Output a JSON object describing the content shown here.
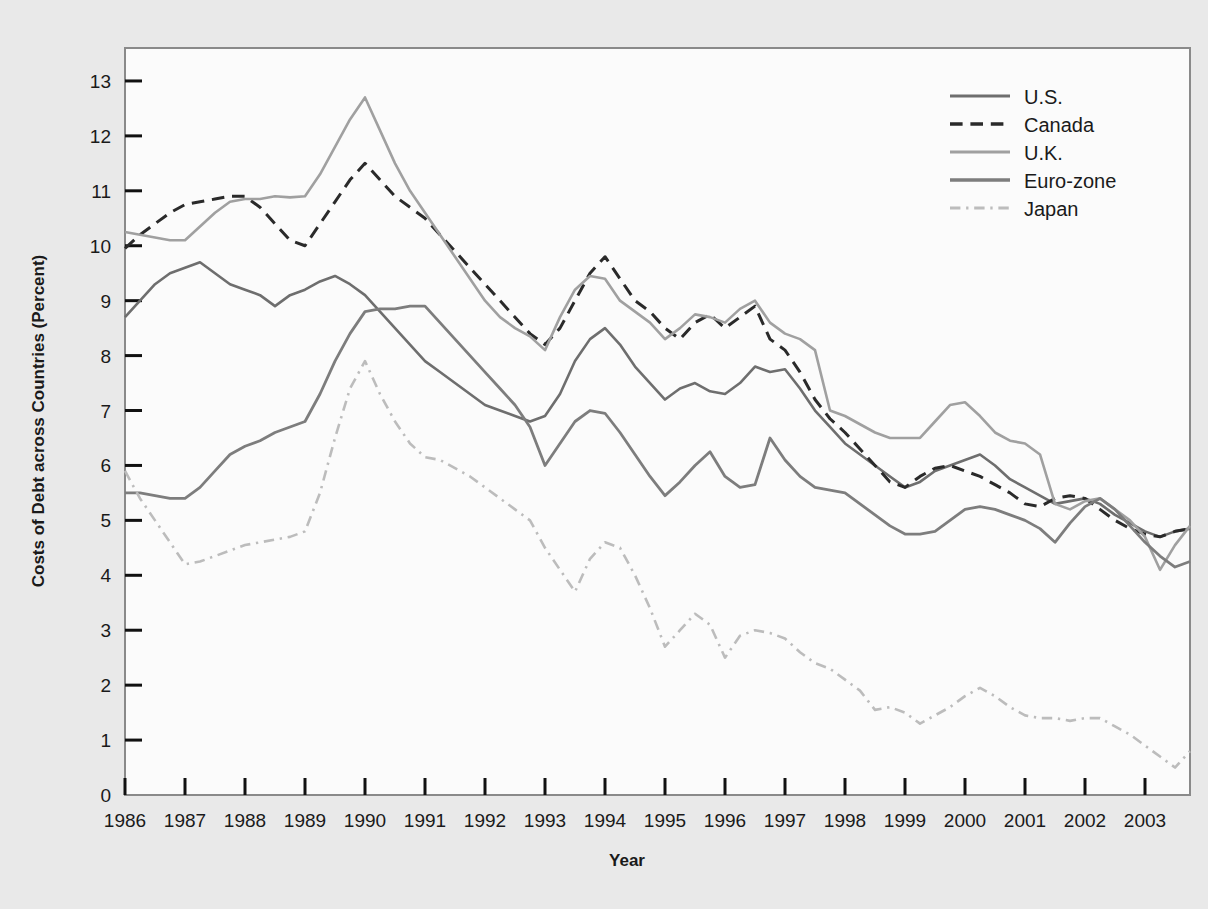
{
  "chart_data": {
    "type": "line",
    "title": "",
    "xlabel": "Year",
    "ylabel": "Costs of Debt across Countries (Percent)",
    "xlim": [
      1986,
      2003.75
    ],
    "ylim": [
      0,
      13.6
    ],
    "yticks": [
      0,
      1,
      2,
      3,
      4,
      5,
      6,
      7,
      8,
      9,
      10,
      11,
      12,
      13
    ],
    "xticks": [
      1986,
      1987,
      1988,
      1989,
      1990,
      1991,
      1992,
      1993,
      1994,
      1995,
      1996,
      1997,
      1998,
      1999,
      2000,
      2001,
      2002,
      2003
    ],
    "grid": false,
    "legend_position": "top-right",
    "frequency": "quarterly",
    "x": [
      1986,
      1986.25,
      1986.5,
      1986.75,
      1987,
      1987.25,
      1987.5,
      1987.75,
      1988,
      1988.25,
      1988.5,
      1988.75,
      1989,
      1989.25,
      1989.5,
      1989.75,
      1990,
      1990.25,
      1990.5,
      1990.75,
      1991,
      1991.25,
      1991.5,
      1991.75,
      1992,
      1992.25,
      1992.5,
      1992.75,
      1993,
      1993.25,
      1993.5,
      1993.75,
      1994,
      1994.25,
      1994.5,
      1994.75,
      1995,
      1995.25,
      1995.5,
      1995.75,
      1996,
      1996.25,
      1996.5,
      1996.75,
      1997,
      1997.25,
      1997.5,
      1997.75,
      1998,
      1998.25,
      1998.5,
      1998.75,
      1999,
      1999.25,
      1999.5,
      1999.75,
      2000,
      2000.25,
      2000.5,
      2000.75,
      2001,
      2001.25,
      2001.5,
      2001.75,
      2002,
      2002.25,
      2002.5,
      2002.75,
      2003,
      2003.25,
      2003.5,
      2003.75
    ],
    "series": [
      {
        "name": "U.S.",
        "color": "#6e6e6e",
        "style": "solid",
        "width": 2.6,
        "values": [
          8.7,
          9.0,
          9.3,
          9.5,
          9.6,
          9.7,
          9.5,
          9.3,
          9.2,
          9.1,
          8.9,
          9.1,
          9.2,
          9.35,
          9.45,
          9.3,
          9.1,
          8.8,
          8.5,
          8.2,
          7.9,
          7.7,
          7.5,
          7.3,
          7.1,
          7.0,
          6.9,
          6.8,
          6.9,
          7.3,
          7.9,
          8.3,
          8.5,
          8.2,
          7.8,
          7.5,
          7.2,
          7.4,
          7.5,
          7.35,
          7.3,
          7.5,
          7.8,
          7.7,
          7.75,
          7.4,
          7.0,
          6.7,
          6.4,
          6.2,
          6.0,
          5.8,
          5.6,
          5.7,
          5.9,
          6.0,
          6.1,
          6.2,
          6.0,
          5.75,
          5.6,
          5.45,
          5.3,
          5.35,
          5.4,
          5.3,
          5.1,
          4.95,
          4.8,
          4.7,
          4.8,
          4.85
        ]
      },
      {
        "name": "Canada",
        "color": "#2a2a2a",
        "style": "dashed",
        "width": 3.0,
        "values": [
          9.95,
          10.2,
          10.4,
          10.6,
          10.75,
          10.8,
          10.85,
          10.9,
          10.9,
          10.7,
          10.4,
          10.1,
          10.0,
          10.4,
          10.8,
          11.2,
          11.5,
          11.2,
          10.9,
          10.7,
          10.5,
          10.2,
          9.9,
          9.6,
          9.3,
          9.0,
          8.7,
          8.4,
          8.2,
          8.5,
          9.0,
          9.5,
          9.8,
          9.4,
          9.0,
          8.8,
          8.5,
          8.3,
          8.6,
          8.75,
          8.5,
          8.7,
          8.9,
          8.3,
          8.1,
          7.7,
          7.2,
          6.85,
          6.6,
          6.3,
          6.0,
          5.7,
          5.6,
          5.8,
          5.95,
          6.0,
          5.9,
          5.8,
          5.65,
          5.5,
          5.3,
          5.25,
          5.4,
          5.45,
          5.4,
          5.2,
          5.0,
          4.85,
          4.75,
          4.7,
          4.8,
          4.85
        ]
      },
      {
        "name": "U.K.",
        "color": "#a0a0a0",
        "style": "solid",
        "width": 2.6,
        "values": [
          10.25,
          10.2,
          10.15,
          10.1,
          10.1,
          10.35,
          10.6,
          10.8,
          10.85,
          10.85,
          10.9,
          10.88,
          10.9,
          11.3,
          11.8,
          12.3,
          12.7,
          12.1,
          11.5,
          11.0,
          10.6,
          10.2,
          9.8,
          9.4,
          9.0,
          8.7,
          8.5,
          8.35,
          8.1,
          8.7,
          9.2,
          9.45,
          9.4,
          9.0,
          8.8,
          8.6,
          8.3,
          8.5,
          8.75,
          8.7,
          8.6,
          8.85,
          9.0,
          8.6,
          8.4,
          8.3,
          8.1,
          7.0,
          6.9,
          6.75,
          6.6,
          6.5,
          6.5,
          6.5,
          6.8,
          7.1,
          7.15,
          6.9,
          6.6,
          6.45,
          6.4,
          6.2,
          5.3,
          5.2,
          5.35,
          5.4,
          5.2,
          5.0,
          4.7,
          4.1,
          4.55,
          4.9
        ]
      },
      {
        "name": "Euro-zone",
        "color": "#7d7d7d",
        "style": "solid",
        "width": 2.8,
        "values": [
          5.5,
          5.5,
          5.45,
          5.4,
          5.4,
          5.6,
          5.9,
          6.2,
          6.35,
          6.45,
          6.6,
          6.7,
          6.8,
          7.3,
          7.9,
          8.4,
          8.8,
          8.85,
          8.85,
          8.9,
          8.9,
          8.6,
          8.3,
          8.0,
          7.7,
          7.4,
          7.1,
          6.7,
          6.0,
          6.4,
          6.8,
          7.0,
          6.95,
          6.6,
          6.2,
          5.8,
          5.45,
          5.7,
          6.0,
          6.25,
          5.8,
          5.6,
          5.65,
          6.5,
          6.1,
          5.8,
          5.6,
          5.55,
          5.5,
          5.3,
          5.1,
          4.9,
          4.75,
          4.75,
          4.8,
          5.0,
          5.2,
          5.25,
          5.2,
          5.1,
          5.0,
          4.85,
          4.6,
          4.95,
          5.25,
          5.4,
          5.2,
          4.9,
          4.6,
          4.35,
          4.15,
          4.25
        ]
      },
      {
        "name": "Japan",
        "color": "#bcbcbc",
        "style": "dashdot",
        "width": 2.6,
        "values": [
          5.9,
          5.4,
          5.0,
          4.6,
          4.2,
          4.25,
          4.35,
          4.45,
          4.55,
          4.6,
          4.65,
          4.7,
          4.8,
          5.5,
          6.5,
          7.4,
          7.9,
          7.3,
          6.8,
          6.4,
          6.15,
          6.1,
          5.95,
          5.8,
          5.6,
          5.4,
          5.2,
          5.0,
          4.5,
          4.1,
          3.7,
          4.3,
          4.6,
          4.5,
          4.0,
          3.4,
          2.7,
          3.0,
          3.3,
          3.1,
          2.5,
          2.9,
          3.0,
          2.95,
          2.85,
          2.6,
          2.4,
          2.3,
          2.1,
          1.9,
          1.55,
          1.6,
          1.5,
          1.3,
          1.45,
          1.6,
          1.8,
          1.95,
          1.8,
          1.6,
          1.45,
          1.4,
          1.4,
          1.35,
          1.4,
          1.4,
          1.25,
          1.1,
          0.9,
          0.7,
          0.5,
          0.8
        ]
      }
    ]
  },
  "legend": {
    "items": [
      {
        "label": "U.S."
      },
      {
        "label": "Canada"
      },
      {
        "label": "U.K."
      },
      {
        "label": "Euro-zone"
      },
      {
        "label": "Japan"
      }
    ]
  }
}
